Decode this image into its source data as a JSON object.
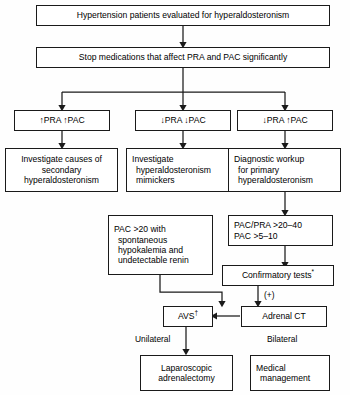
{
  "diagram": {
    "nodes": {
      "start": {
        "text": "Hypertension patients evaluated for hyperaldosteronism"
      },
      "stop_meds": {
        "text": "Stop medications that affect PRA and PAC significantly"
      },
      "branch_high_high": {
        "text": "↑PRA ↑PAC"
      },
      "branch_low_low": {
        "text": "↓PRA ↓PAC"
      },
      "branch_low_high": {
        "text": "↓PRA ↑PAC"
      },
      "secondary": {
        "line1": "Investigate causes of",
        "line2": "secondary",
        "line3": "hyperaldosteronism"
      },
      "mimickers": {
        "line1": "Investigate",
        "line2": "hyperaldosteronism",
        "line3": "mimickers"
      },
      "primary_workup": {
        "line1": "Diagnostic workup",
        "line2": "for primary",
        "line3": "hyperaldosteronism"
      },
      "pac_criteria": {
        "line1": "PAC >20 with",
        "line2": "spontaneous",
        "line3": "hypokalemia and",
        "line4": "undetectable renin"
      },
      "ratio_criteria": {
        "line1": "PAC/PRA >20–40",
        "line2": "PAC >5–10"
      },
      "confirmatory": {
        "text": "Confirmatory tests",
        "marker": "*"
      },
      "avs": {
        "text": "AVS",
        "marker": "†"
      },
      "adrenal_ct": {
        "text": "Adrenal CT"
      },
      "laparoscopic": {
        "line1": "Laparoscopic",
        "line2": "adrenalectomy"
      },
      "medical": {
        "line1": "Medical",
        "line2": "management"
      }
    },
    "edge_labels": {
      "positive": "(+)",
      "unilateral": "Unilateral",
      "bilateral": "Bilateral"
    },
    "colors": {
      "border": "#1a1a1a",
      "text": "#000000",
      "background": "#ffffff"
    }
  }
}
